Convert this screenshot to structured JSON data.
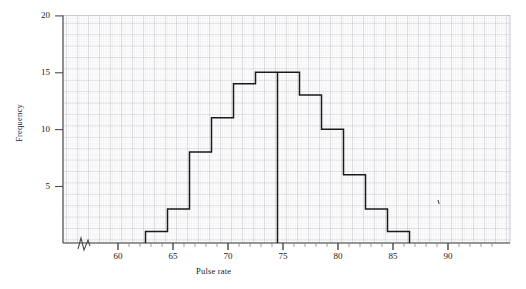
{
  "chart_data": {
    "type": "bar",
    "title": "",
    "subtitle": "",
    "xlabel": "Pulse rate",
    "ylabel": "Frequency",
    "xlim": [
      57,
      95
    ],
    "ylim": [
      0,
      20
    ],
    "x_ticks": [
      60,
      65,
      70,
      75,
      80,
      85,
      90
    ],
    "x_tick_labels": [
      "60",
      "65",
      "70",
      "75",
      "80",
      "85",
      "90"
    ],
    "x_minor_tick_step": 1,
    "y_ticks": [
      5,
      10,
      15,
      20
    ],
    "y_tick_labels": [
      "5",
      "10",
      "15",
      "20"
    ],
    "grid": "graph-paper (minor 0.2 units, major 1 unit)",
    "legend": "none",
    "axis_break": "zigzag break on x-axis between origin and 60",
    "bin_width": 2,
    "bin_edges": [
      62.5,
      64.5,
      66.5,
      68.5,
      70.5,
      72.5,
      74.5,
      76.5,
      78.5,
      80.5,
      82.5,
      84.5,
      86.5
    ],
    "categories": [
      "62.5-64.5",
      "64.5-66.5",
      "66.5-68.5",
      "68.5-70.5",
      "70.5-72.5",
      "72.5-74.5",
      "74.5-76.5",
      "76.5-78.5",
      "78.5-80.5",
      "80.5-82.5",
      "82.5-84.5",
      "84.5-86.5"
    ],
    "values": [
      1,
      3,
      8,
      11,
      14,
      15,
      15,
      13,
      10,
      6,
      3,
      1
    ],
    "bar_style": "outline only, no fill, black stroke",
    "colors": {
      "bar_stroke": "#1a1a1a",
      "axis": "#555555",
      "grid_minor": "#d8d8dc",
      "grid_major": "#a9a9b4",
      "background": "#ffffff"
    }
  },
  "annotations": {
    "stray_mark": "'"
  }
}
